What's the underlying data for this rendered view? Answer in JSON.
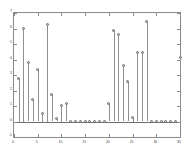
{
  "chart_data": {
    "type": "scatter",
    "plot_style": "stem",
    "title": "",
    "subtitle": "",
    "xlabel": "",
    "ylabel": "",
    "xlim": [
      0,
      35
    ],
    "ylim": [
      -1,
      7
    ],
    "grid": false,
    "legend": null,
    "xticks": [
      0,
      5,
      10,
      15,
      20,
      25,
      30,
      35
    ],
    "xtick_labels": [
      "0",
      "5",
      "10",
      "15",
      "20",
      "25",
      "30",
      "35"
    ],
    "yticks": [
      -1,
      0,
      1,
      2,
      3,
      4,
      5,
      6,
      7
    ],
    "ytick_labels": [
      "-1",
      "0",
      "1",
      "2",
      "3",
      "4",
      "5",
      "6",
      "7"
    ],
    "marker": "circle",
    "marker_color": "#bdbdbd",
    "marker_edge_color": "#6d6d6d",
    "stem_color": "#8f8f8f",
    "baseline_color": "#6f6f6f",
    "axis_color": "#8a8a8a",
    "background_color": "#ffffff",
    "x": [
      1,
      2,
      3,
      4,
      5,
      6,
      7,
      8,
      9,
      10,
      11,
      12,
      13,
      14,
      15,
      16,
      17,
      18,
      19,
      20,
      21,
      22,
      23,
      24,
      25,
      26,
      27,
      28,
      29,
      30,
      31,
      32,
      33,
      34,
      35
    ],
    "values": [
      2.75,
      6.0,
      3.8,
      1.4,
      3.3,
      0.5,
      6.25,
      1.7,
      0.15,
      1.0,
      1.1,
      0.0,
      0.0,
      0.0,
      0.0,
      0.0,
      0.0,
      0.0,
      0.0,
      1.15,
      5.85,
      5.6,
      3.6,
      2.55,
      0.25,
      4.4,
      4.4,
      6.45,
      0.0,
      0.0,
      0.0,
      0.0,
      0.0,
      0.0,
      4.1
    ]
  }
}
